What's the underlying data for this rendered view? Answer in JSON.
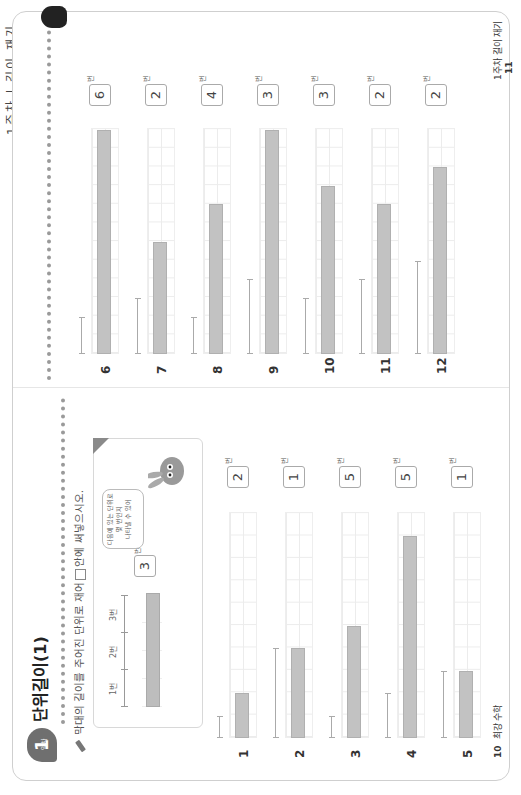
{
  "edge_text": "1주차 | 길이 재기",
  "left_page": {
    "badge": {
      "number": "1",
      "label": "일차"
    },
    "title": "단위길이(1)",
    "instruction_before": "막대의 길이를 주어진 단위로 재어",
    "instruction_after": "안에 써넣으시오.",
    "example": {
      "ruler_labels": [
        "1번",
        "2번",
        "3번"
      ],
      "answer": "3",
      "unit": "번",
      "bubble_lines": [
        "다음에 있는 단위로",
        "몇 번인지",
        "나타낼 수 있어"
      ]
    },
    "problems": [
      {
        "number": "1",
        "unit_cells": 1,
        "bar_cells": 2,
        "answer": "2",
        "unit_label": "번"
      },
      {
        "number": "2",
        "unit_cells": 4,
        "bar_cells": 4,
        "answer": "1",
        "unit_label": "번"
      },
      {
        "number": "3",
        "unit_cells": 1,
        "bar_cells": 5,
        "answer": "5",
        "unit_label": "번"
      },
      {
        "number": "4",
        "unit_cells": 2,
        "bar_cells": 10,
        "answer": "5",
        "unit_label": "번"
      },
      {
        "number": "5",
        "unit_cells": 3,
        "bar_cells": 3,
        "answer": "1",
        "unit_label": "번"
      }
    ],
    "footer": {
      "page": "10",
      "label": "최강 수학"
    }
  },
  "right_page": {
    "problems": [
      {
        "number": "6",
        "unit_cells": 2,
        "bar_cells": 12,
        "answer": "6",
        "unit_label": "번"
      },
      {
        "number": "7",
        "unit_cells": 3,
        "bar_cells": 6,
        "answer": "2",
        "unit_label": "번"
      },
      {
        "number": "8",
        "unit_cells": 2,
        "bar_cells": 8,
        "answer": "4",
        "unit_label": "번"
      },
      {
        "number": "9",
        "unit_cells": 4,
        "bar_cells": 12,
        "answer": "3",
        "unit_label": "번"
      },
      {
        "number": "10",
        "unit_cells": 3,
        "bar_cells": 9,
        "answer": "3",
        "unit_label": "번"
      },
      {
        "number": "11",
        "unit_cells": 4,
        "bar_cells": 8,
        "answer": "2",
        "unit_label": "번"
      },
      {
        "number": "12",
        "unit_cells": 5,
        "bar_cells": 10,
        "answer": "2",
        "unit_label": "번"
      }
    ],
    "footer": {
      "page": "11",
      "label": "1주차 길이 재기"
    }
  }
}
